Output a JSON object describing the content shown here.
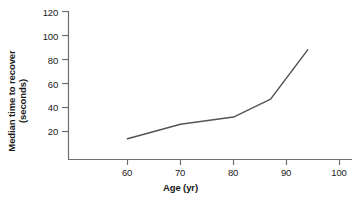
{
  "chart_data": {
    "type": "line",
    "title": "",
    "xlabel": "Age (yr)",
    "ylabel": "Median time to recover (seconds)",
    "ylabel_lines": [
      "Median time to recover",
      "(seconds)"
    ],
    "xlim": [
      52,
      103
    ],
    "ylim": [
      0,
      120
    ],
    "xticks": [
      60,
      70,
      80,
      90,
      100
    ],
    "xtick_labels": [
      "60",
      "70",
      "80",
      "90",
      "100"
    ],
    "yticks": [
      20,
      40,
      60,
      80,
      100,
      120
    ],
    "ytick_labels": [
      "20",
      "40",
      "60",
      "80",
      "100",
      "120"
    ],
    "grid": false,
    "legend": null,
    "series": [
      {
        "name": "Median time to recover",
        "color": "#555555",
        "x": [
          60,
          70,
          80,
          87,
          94
        ],
        "values": [
          14,
          26,
          32,
          47,
          88
        ]
      }
    ]
  },
  "axes": {
    "line_color": "#6e6e6e",
    "text_color": "#1a1a1a"
  }
}
